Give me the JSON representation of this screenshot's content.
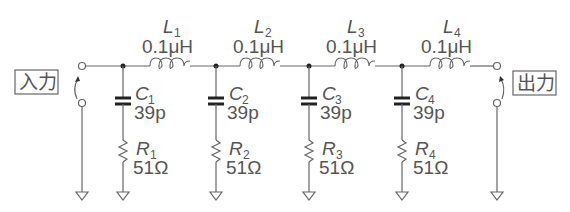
{
  "diagram": {
    "type": "ladder-lowpass-filter",
    "input_label": "入力",
    "output_label": "出力",
    "inductors": [
      {
        "name": "L",
        "sub": "1",
        "value": "0.1μH"
      },
      {
        "name": "L",
        "sub": "2",
        "value": "0.1μH"
      },
      {
        "name": "L",
        "sub": "3",
        "value": "0.1μH"
      },
      {
        "name": "L",
        "sub": "4",
        "value": "0.1μH"
      }
    ],
    "capacitors": [
      {
        "name": "C",
        "sub": "1",
        "value": "39p"
      },
      {
        "name": "C",
        "sub": "2",
        "value": "39p"
      },
      {
        "name": "C",
        "sub": "3",
        "value": "39p"
      },
      {
        "name": "C",
        "sub": "4",
        "value": "39p"
      }
    ],
    "resistors": [
      {
        "name": "R",
        "sub": "1",
        "value": "51Ω"
      },
      {
        "name": "R",
        "sub": "2",
        "value": "51Ω"
      },
      {
        "name": "R",
        "sub": "3",
        "value": "51Ω"
      },
      {
        "name": "R",
        "sub": "4",
        "value": "51Ω"
      }
    ]
  }
}
